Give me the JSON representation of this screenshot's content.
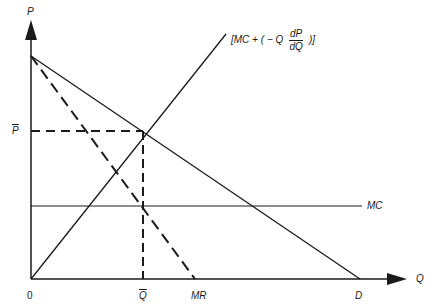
{
  "diagram": {
    "type": "monopoly / monopsony-style pricing diagram",
    "axes": {
      "y_label": "P",
      "x_label": "Q",
      "origin_label": "0"
    },
    "curves": [
      {
        "name": "Demand",
        "label": "D",
        "style": "solid"
      },
      {
        "name": "Marginal revenue",
        "label": "MR",
        "style": "dashed"
      },
      {
        "name": "Marginal cost",
        "label": "MC",
        "style": "solid, horizontal"
      },
      {
        "name": "MC plus markup",
        "label": "[MC + (−Q dP/dQ )]",
        "style": "solid"
      }
    ],
    "equilibrium": {
      "price_label": "P̄",
      "quantity_label": "Q̄",
      "guides_style": "dashed"
    }
  },
  "labels": {
    "p_axis": "P",
    "q_axis": "Q",
    "origin": "0",
    "p_bar": "P",
    "q_bar": "Q",
    "mr": "MR",
    "d": "D",
    "mc": "MC",
    "mc_plus_prefix": "[MC + ( − Q",
    "mc_plus_num": "dP",
    "mc_plus_den": "dQ",
    "mc_plus_suffix": ")]"
  },
  "colors": {
    "ink": "#1a1a1a",
    "background": "#ffffff"
  }
}
